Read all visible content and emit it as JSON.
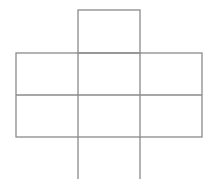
{
  "diagram": {
    "type": "grid-net",
    "stroke_color": "#8a8a8a",
    "background": "#ffffff",
    "cells": {
      "top": {
        "row": 0,
        "col": 1
      },
      "middle_rows": [
        [
          {
            "row": 1,
            "col": 0
          },
          {
            "row": 1,
            "col": 1
          },
          {
            "row": 1,
            "col": 2
          }
        ],
        [
          {
            "row": 2,
            "col": 0
          },
          {
            "row": 2,
            "col": 1
          },
          {
            "row": 2,
            "col": 2
          }
        ]
      ],
      "bottom": {
        "row": 3,
        "col": 1,
        "open_bottom": true
      }
    },
    "geometry": {
      "x": [
        16,
        78,
        140,
        202
      ],
      "y": [
        10,
        53,
        95,
        137,
        179
      ]
    }
  }
}
